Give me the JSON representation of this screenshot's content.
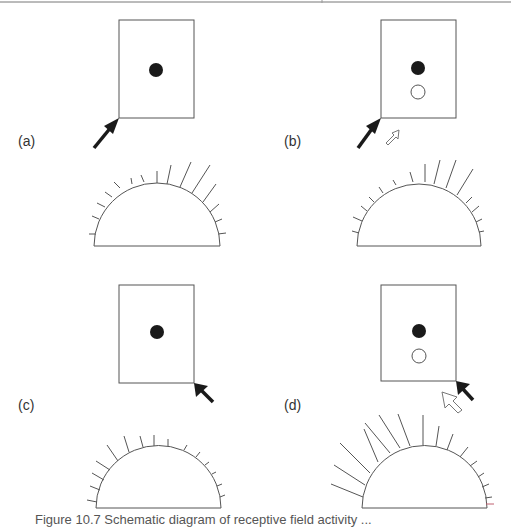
{
  "figure": {
    "caption": "Figure 10.7  Schematic diagram of receptive field activity ... ",
    "colors": {
      "line": "#555555",
      "ink": "#1a1a1a",
      "accent_tick": "#c06070"
    },
    "panels": [
      {
        "label": "(a)",
        "stimulus": "dark arrow at lower-left corner",
        "dots": [
          "filled"
        ],
        "response": "longer spikes on upper-right of arc"
      },
      {
        "label": "(b)",
        "stimulus": "dark arrow at lower-left corner plus small outlined arrow",
        "dots": [
          "filled",
          "open"
        ],
        "response": "longer spikes on upper-right of arc"
      },
      {
        "label": "(c)",
        "stimulus": "dark arrow at lower-right corner",
        "dots": [
          "filled"
        ],
        "response": "longer spikes on upper-left of arc"
      },
      {
        "label": "(d)",
        "stimulus": "dark arrow at lower-right corner plus large outlined arrow",
        "dots": [
          "filled",
          "open"
        ],
        "response": "much longer spikes on left of arc"
      }
    ]
  }
}
